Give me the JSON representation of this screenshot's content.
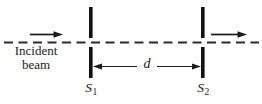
{
  "diagram": {
    "labels": {
      "incident_line1": "Incident",
      "incident_line2": "beam",
      "distance": "d",
      "s1": {
        "base": "S",
        "sub": "1"
      },
      "s2": {
        "base": "S",
        "sub": "2"
      }
    },
    "colors": {
      "ink": "#1c1c1c",
      "axis_dash": "#2b2b2b",
      "background": "#ffffff"
    }
  }
}
